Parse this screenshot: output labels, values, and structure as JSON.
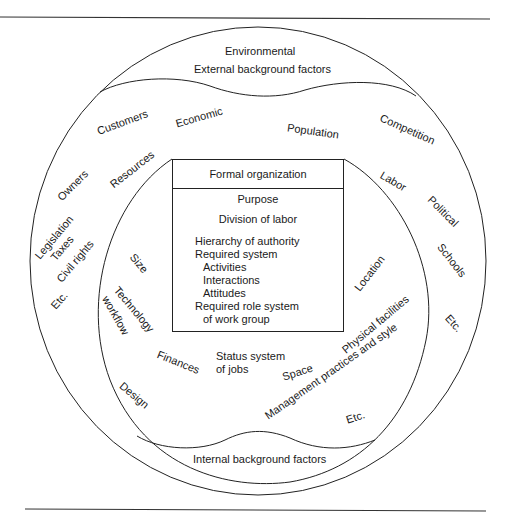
{
  "diagram": {
    "title_region": {
      "heading": "Environmental",
      "subheading": "External background factors"
    },
    "external_factors": [
      {
        "id": "customers",
        "label": "Customers"
      },
      {
        "id": "economic",
        "label": "Economic"
      },
      {
        "id": "population",
        "label": "Population"
      },
      {
        "id": "competition",
        "label": "Competition"
      },
      {
        "id": "owners",
        "label": "Owners"
      },
      {
        "id": "resources",
        "label": "Resources"
      },
      {
        "id": "labor",
        "label": "Labor"
      },
      {
        "id": "political",
        "label": "Political"
      },
      {
        "id": "legislation",
        "label": "Legislation"
      },
      {
        "id": "taxes",
        "label": "Taxes"
      },
      {
        "id": "civil_rights",
        "label": "Civil rights"
      },
      {
        "id": "schools",
        "label": "Schools"
      },
      {
        "id": "etc_left",
        "label": "Etc."
      },
      {
        "id": "etc_right",
        "label": "Etc."
      }
    ],
    "internal_factors": [
      {
        "id": "size",
        "label": "Size"
      },
      {
        "id": "technology",
        "label": "Technology"
      },
      {
        "id": "workflow",
        "label": "workflow"
      },
      {
        "id": "location",
        "label": "Location"
      },
      {
        "id": "physical_facilities",
        "label": "Physical facilities"
      },
      {
        "id": "finances",
        "label": "Finances"
      },
      {
        "id": "status_system",
        "label": "Status system"
      },
      {
        "id": "of_jobs",
        "label": "of jobs"
      },
      {
        "id": "space",
        "label": "Space"
      },
      {
        "id": "design",
        "label": "Design"
      },
      {
        "id": "management",
        "label": "Management practices and style"
      },
      {
        "id": "etc_inner",
        "label": "Etc."
      }
    ],
    "internal_region_label": "Internal background factors",
    "formal_organization": {
      "title": "Formal organization",
      "items": [
        "Purpose",
        "Division of labor",
        "Hierarchy of authority",
        "Required system",
        "Activities",
        "Interactions",
        "Attitudes",
        "Required role system",
        "of work group"
      ]
    }
  }
}
